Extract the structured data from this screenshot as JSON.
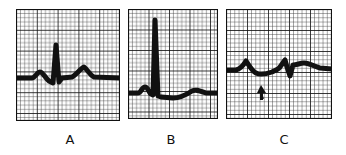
{
  "figure": {
    "type": "ecg-strip-comparison",
    "colors": {
      "grid_minor": "#3a3a3a",
      "grid_major": "#111111",
      "trace": "#111111",
      "background": "#ffffff"
    },
    "panels": [
      {
        "id": "A",
        "label": "A",
        "description": "Normal ECG complex: small P wave, tall narrow QRS, upright T wave"
      },
      {
        "id": "B",
        "label": "B",
        "description": "ECG complex with very tall R wave and low, flattened T wave"
      },
      {
        "id": "C",
        "label": "C",
        "description": "ECG complex with low-voltage, notched QRS; arrow marks depressed segment"
      }
    ],
    "annotations": [
      {
        "panel": "C",
        "type": "arrow",
        "direction": "up",
        "marks": "depressed segment after P wave"
      }
    ]
  }
}
